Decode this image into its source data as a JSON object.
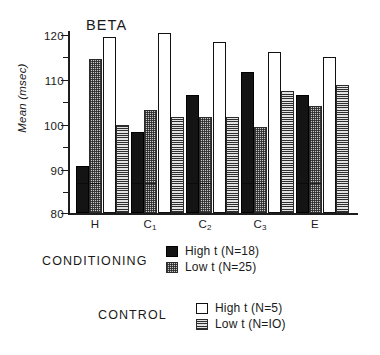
{
  "figure": {
    "panel_title": "BETA",
    "y_axis_label": "Mean (msec)",
    "y_ticks": [
      "120",
      "110",
      "100",
      "90",
      "80"
    ],
    "x_ticks": [
      "H",
      "C",
      "C",
      "C",
      "E"
    ],
    "x_tick_subscripts": [
      "",
      "1",
      "2",
      "3",
      ""
    ],
    "legend_group_1_heading": "CONDITIONING",
    "legend_group_2_heading": "CONTROL",
    "legend": [
      {
        "label": "High t  (N=18)",
        "swatch": "solid-black-swatch",
        "group": "CONDITIONING"
      },
      {
        "label": "Low t   (N=25)",
        "swatch": "checkered-gray-swatch",
        "group": "CONDITIONING"
      },
      {
        "label": "High t (N=5)",
        "swatch": "open-white-swatch",
        "group": "CONTROL"
      },
      {
        "label": "Low t (N=IO)",
        "swatch": "horizontal-stripe-swatch",
        "group": "CONTROL"
      }
    ],
    "colors": {
      "axis": "#1d1d1d",
      "high_t_conditioning": "#141414",
      "low_t_conditioning": "#c9c9c9",
      "high_t_control": "#ffffff",
      "low_t_control": "#b9b9b9"
    }
  },
  "chart_data": {
    "type": "bar",
    "title": "BETA",
    "xlabel": "",
    "ylabel": "Mean (msec)",
    "ylim": [
      80,
      122.5
    ],
    "ytick_values": [
      120,
      110,
      100,
      90,
      80
    ],
    "yminor_step": 5,
    "grid": false,
    "legend_position": "bottom-right",
    "categories": [
      "H",
      "C1",
      "C2",
      "C3",
      "E"
    ],
    "series": [
      {
        "name": "High t (N=18)",
        "group": "CONDITIONING",
        "values": [
          91.0,
          99.0,
          107.5,
          113.0,
          107.5
        ]
      },
      {
        "name": "Low t (N=25)",
        "group": "CONDITIONING",
        "values": [
          116.0,
          104.0,
          102.5,
          100.0,
          105.0
        ]
      },
      {
        "name": "High t (N=5)",
        "group": "CONTROL",
        "values": [
          121.0,
          122.0,
          120.0,
          117.5,
          116.5
        ]
      },
      {
        "name": "Low t (N=10)",
        "group": "CONTROL",
        "values": [
          100.5,
          102.5,
          102.5,
          108.5,
          110.0
        ]
      }
    ]
  }
}
